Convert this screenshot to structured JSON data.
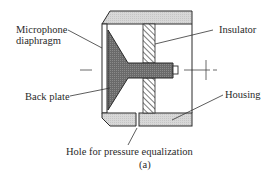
{
  "figure": {
    "caption": "(a)",
    "labels": {
      "diaphragm_line1": "Microphone",
      "diaphragm_line2": "diaphragm",
      "insulator": "Insulator",
      "back_plate": "Back plate",
      "housing": "Housing",
      "hole": "Hole for pressure equalization"
    },
    "colors": {
      "line": "#2a2a2a",
      "housing_fill": "#d6d6d6",
      "backplate_fill": "#6e6e6e",
      "hatch": "#333333",
      "background": "#ffffff"
    }
  }
}
